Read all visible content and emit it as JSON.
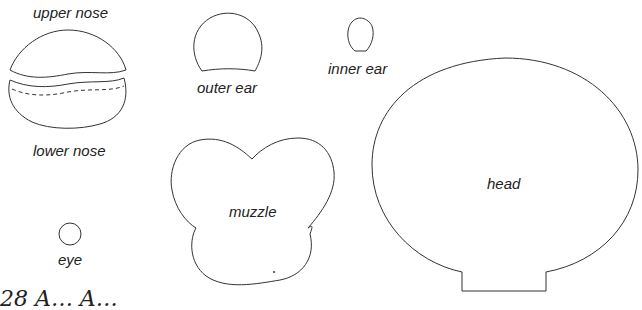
{
  "diagram": {
    "type": "sewing-pattern-pieces",
    "pieces": [
      {
        "id": "upper-nose",
        "label": "upper nose"
      },
      {
        "id": "lower-nose",
        "label": "lower nose"
      },
      {
        "id": "outer-ear",
        "label": "outer ear"
      },
      {
        "id": "inner-ear",
        "label": "inner ear"
      },
      {
        "id": "muzzle",
        "label": "muzzle"
      },
      {
        "id": "eye",
        "label": "eye"
      },
      {
        "id": "head",
        "label": "head"
      }
    ],
    "page_fragment": "28 A… A…",
    "colors": {
      "stroke": "#333333",
      "text": "#222222",
      "background": "#ffffff"
    }
  }
}
